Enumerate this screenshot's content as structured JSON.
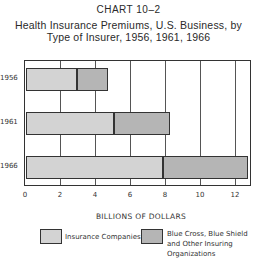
{
  "chart_data": {
    "type": "bar",
    "orientation": "horizontal",
    "stacked": true,
    "chart_label": "CHART 10–2",
    "title": "Health Insurance Premiums, U.S. Business, by Type of Insurer, 1956, 1961, 1966",
    "title_line1": "Health Insurance Premiums, U.S. Business, by",
    "title_line2": "Type of Insurer, 1956, 1961, 1966",
    "categories": [
      "1956",
      "1961",
      "1966"
    ],
    "series": [
      {
        "name": "Insurance Companies",
        "values": [
          2.9,
          5.0,
          7.8
        ],
        "color": "#d3d3d3"
      },
      {
        "name": "Blue Cross, Blue Shield and Other Insuring Organizations",
        "values": [
          1.8,
          3.2,
          4.9
        ],
        "color": "#b5b5b5"
      }
    ],
    "totals": [
      4.7,
      8.2,
      12.7
    ],
    "xlabel": "BILLIONS OF DOLLARS",
    "ylabel": "",
    "xlim": [
      0,
      13
    ],
    "xticks": [
      "0",
      "2",
      "4",
      "6",
      "8",
      "10",
      "12"
    ],
    "grid": true,
    "legend_position": "bottom"
  },
  "legend": {
    "item1": "Insurance Companies",
    "item2_line1": "Blue Cross, Blue Shield",
    "item2_line2": "and Other Insuring",
    "item2_line3": "Organizations"
  }
}
